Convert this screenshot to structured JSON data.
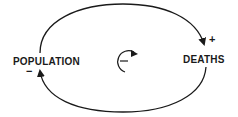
{
  "diagram": {
    "type": "causal-loop",
    "nodes": [
      {
        "id": "population",
        "label": "POPULATION"
      },
      {
        "id": "deaths",
        "label": "DEATHS"
      }
    ],
    "links": [
      {
        "from": "population",
        "to": "deaths",
        "polarity": "+"
      },
      {
        "from": "deaths",
        "to": "population",
        "polarity": "−"
      }
    ],
    "loop": {
      "polarity": "−"
    }
  }
}
